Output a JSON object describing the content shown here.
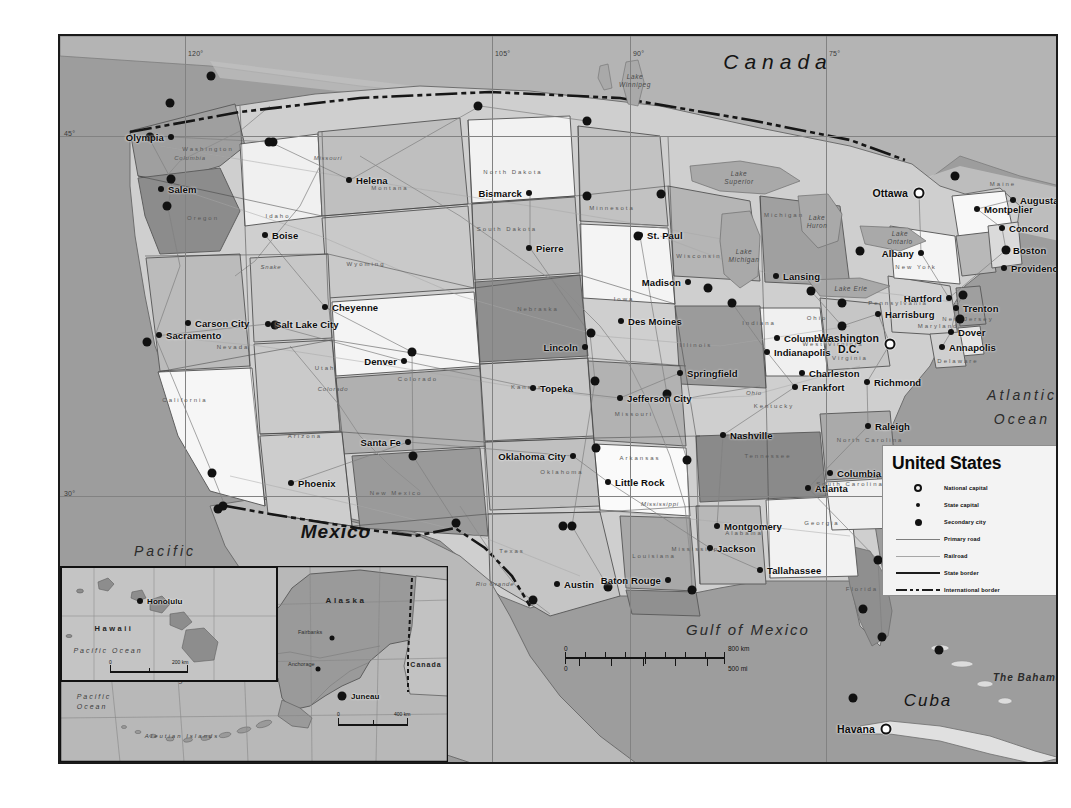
{
  "map": {
    "title": "United States",
    "frame": {
      "width": 1000,
      "height": 730
    }
  },
  "legend": {
    "title": "United States",
    "items": [
      {
        "symbol": "national-capital-icon",
        "label": "National capital"
      },
      {
        "symbol": "state-capital-icon",
        "label": "State capital"
      },
      {
        "symbol": "secondary-city-icon",
        "label": "Secondary city"
      },
      {
        "symbol": "primary-road-icon",
        "label": "Primary road"
      },
      {
        "symbol": "railroad-icon",
        "label": "Railroad"
      },
      {
        "symbol": "state-border-icon",
        "label": "State border"
      },
      {
        "symbol": "international-border-icon",
        "label": "International border"
      }
    ]
  },
  "scalebar": {
    "km_zero": "0",
    "km_max": "800 km",
    "mi_zero": "0",
    "mi_max": "500 mi"
  },
  "graticule": {
    "longitudes": [
      "120°",
      "105°",
      "90°",
      "75°"
    ],
    "latitudes": [
      "45°",
      "30°"
    ]
  },
  "geo_labels": [
    {
      "name": "canada",
      "text": "Canada",
      "x": 718,
      "y": 26,
      "cls": "geo-country"
    },
    {
      "name": "mexico",
      "text": "Mexico",
      "x": 276,
      "y": 496,
      "cls": "geo-mexico"
    },
    {
      "name": "cuba",
      "text": "Cuba",
      "x": 868,
      "y": 665,
      "cls": "geo-cuba"
    },
    {
      "name": "gulf-of-mexico",
      "text": "Gulf of Mexico",
      "x": 688,
      "y": 593,
      "cls": "geo-gulf"
    },
    {
      "name": "the-bahamas",
      "text": "The Bahamas",
      "x": 971,
      "y": 641,
      "cls": "geo-sea-sm"
    }
  ],
  "ocean_labels": [
    {
      "name": "atlantic-ocean",
      "line1": "Atlantic",
      "line2": "Ocean",
      "x": 962,
      "y": 372
    },
    {
      "name": "pacific-ocean",
      "line1": "Pacific",
      "line2": "Ocean",
      "x": 105,
      "y": 528
    }
  ],
  "lakes": [
    {
      "name": "lake-winnipeg",
      "text": "Lake\nWinnipeg",
      "x": 575,
      "y": 45
    },
    {
      "name": "lake-superior",
      "text": "Lake\nSuperior",
      "x": 679,
      "y": 142
    },
    {
      "name": "lake-huron",
      "text": "Lake\nHuron",
      "x": 757,
      "y": 186
    },
    {
      "name": "lake-michigan",
      "text": "Lake\nMichigan",
      "x": 684,
      "y": 220
    },
    {
      "name": "lake-ontario",
      "text": "Lake\nOntario",
      "x": 840,
      "y": 202
    },
    {
      "name": "lake-erie",
      "text": "Lake Erie",
      "x": 791,
      "y": 253
    }
  ],
  "cities": [
    {
      "name": "olympia",
      "label": "Olympia",
      "x": 111,
      "y": 101,
      "type": "state",
      "pos": "left"
    },
    {
      "name": "salem",
      "label": "Salem",
      "x": 101,
      "y": 153,
      "type": "state",
      "pos": "right"
    },
    {
      "name": "boise",
      "label": "Boise",
      "x": 205,
      "y": 199,
      "type": "state",
      "pos": "right"
    },
    {
      "name": "helena",
      "label": "Helena",
      "x": 289,
      "y": 144,
      "type": "state",
      "pos": "right"
    },
    {
      "name": "bismarck",
      "label": "Bismarck",
      "x": 469,
      "y": 157,
      "type": "state",
      "pos": "left"
    },
    {
      "name": "pierre",
      "label": "Pierre",
      "x": 469,
      "y": 212,
      "type": "state",
      "pos": "right"
    },
    {
      "name": "st-paul",
      "label": "St. Paul",
      "x": 580,
      "y": 199,
      "type": "state",
      "pos": "right"
    },
    {
      "name": "madison",
      "label": "Madison",
      "x": 628,
      "y": 246,
      "type": "state",
      "pos": "left"
    },
    {
      "name": "des-moines",
      "label": "Des Moines",
      "x": 561,
      "y": 285,
      "type": "state",
      "pos": "right"
    },
    {
      "name": "lincoln",
      "label": "Lincoln",
      "x": 525,
      "y": 311,
      "type": "state",
      "pos": "left"
    },
    {
      "name": "cheyenne",
      "label": "Cheyenne",
      "x": 265,
      "y": 271,
      "type": "state",
      "pos": "right"
    },
    {
      "name": "denver",
      "label": "Denver",
      "x": 344,
      "y": 325,
      "type": "state",
      "pos": "left"
    },
    {
      "name": "salt-lake-city",
      "label": "Salt Lake City",
      "x": 208,
      "y": 288,
      "type": "state",
      "pos": "right"
    },
    {
      "name": "carson-city",
      "label": "Carson City",
      "x": 128,
      "y": 287,
      "type": "state",
      "pos": "right"
    },
    {
      "name": "sacramento",
      "label": "Sacramento",
      "x": 99,
      "y": 299,
      "type": "state",
      "pos": "right"
    },
    {
      "name": "santa-fe",
      "label": "Santa Fe",
      "x": 348,
      "y": 406,
      "type": "state",
      "pos": "left"
    },
    {
      "name": "phoenix",
      "label": "Phoenix",
      "x": 231,
      "y": 447,
      "type": "state",
      "pos": "right"
    },
    {
      "name": "oklahoma-city",
      "label": "Oklahoma City",
      "x": 513,
      "y": 420,
      "type": "state",
      "pos": "left"
    },
    {
      "name": "topeka",
      "label": "Topeka",
      "x": 473,
      "y": 352,
      "type": "state",
      "pos": "right"
    },
    {
      "name": "jefferson-city",
      "label": "Jefferson City",
      "x": 560,
      "y": 362,
      "type": "state",
      "pos": "right"
    },
    {
      "name": "springfield",
      "label": "Springfield",
      "x": 620,
      "y": 337,
      "type": "state",
      "pos": "right"
    },
    {
      "name": "little-rock",
      "label": "Little Rock",
      "x": 548,
      "y": 446,
      "type": "state",
      "pos": "right"
    },
    {
      "name": "austin",
      "label": "Austin",
      "x": 497,
      "y": 548,
      "type": "state",
      "pos": "right"
    },
    {
      "name": "baton-rouge",
      "label": "Baton Rouge",
      "x": 608,
      "y": 544,
      "type": "state",
      "pos": "left"
    },
    {
      "name": "jackson",
      "label": "Jackson",
      "x": 650,
      "y": 512,
      "type": "state",
      "pos": "right"
    },
    {
      "name": "montgomery",
      "label": "Montgomery",
      "x": 657,
      "y": 490,
      "type": "state",
      "pos": "right"
    },
    {
      "name": "tallahassee",
      "label": "Tallahassee",
      "x": 700,
      "y": 534,
      "type": "state",
      "pos": "right"
    },
    {
      "name": "nashville",
      "label": "Nashville",
      "x": 663,
      "y": 399,
      "type": "state",
      "pos": "right"
    },
    {
      "name": "atlanta",
      "label": "Atlanta",
      "x": 748,
      "y": 452,
      "type": "state",
      "pos": "right"
    },
    {
      "name": "columbia",
      "label": "Columbia",
      "x": 770,
      "y": 437,
      "type": "state",
      "pos": "right"
    },
    {
      "name": "raleigh",
      "label": "Raleigh",
      "x": 808,
      "y": 390,
      "type": "state",
      "pos": "right"
    },
    {
      "name": "richmond",
      "label": "Richmond",
      "x": 807,
      "y": 346,
      "type": "state",
      "pos": "right"
    },
    {
      "name": "frankfort",
      "label": "Frankfort",
      "x": 735,
      "y": 351,
      "type": "state",
      "pos": "right"
    },
    {
      "name": "charleston",
      "label": "Charleston",
      "x": 742,
      "y": 337,
      "type": "state",
      "pos": "right"
    },
    {
      "name": "columbus",
      "label": "Columbus",
      "x": 717,
      "y": 302,
      "type": "state",
      "pos": "right"
    },
    {
      "name": "indianapolis",
      "label": "Indianapolis",
      "x": 707,
      "y": 316,
      "type": "state",
      "pos": "right"
    },
    {
      "name": "lansing",
      "label": "Lansing",
      "x": 716,
      "y": 240,
      "type": "state",
      "pos": "right"
    },
    {
      "name": "harrisburg",
      "label": "Harrisburg",
      "x": 818,
      "y": 278,
      "type": "state",
      "pos": "right"
    },
    {
      "name": "washington-dc",
      "label": "Washington",
      "x": 830,
      "y": 308,
      "type": "national",
      "pos": "left"
    },
    {
      "name": "annapolis",
      "label": "Annapolis",
      "x": 882,
      "y": 311,
      "type": "state",
      "pos": "right"
    },
    {
      "name": "dover",
      "label": "Dover",
      "x": 891,
      "y": 296,
      "type": "state",
      "pos": "right"
    },
    {
      "name": "trenton",
      "label": "Trenton",
      "x": 896,
      "y": 272,
      "type": "state",
      "pos": "right"
    },
    {
      "name": "hartford",
      "label": "Hartford",
      "x": 889,
      "y": 262,
      "type": "state",
      "pos": "left"
    },
    {
      "name": "albany",
      "label": "Albany",
      "x": 861,
      "y": 217,
      "type": "state",
      "pos": "left"
    },
    {
      "name": "providence",
      "label": "Providence",
      "x": 944,
      "y": 232,
      "type": "state",
      "pos": "right"
    },
    {
      "name": "boston",
      "label": "Boston",
      "x": 946,
      "y": 214,
      "type": "secondary",
      "pos": "right"
    },
    {
      "name": "concord",
      "label": "Concord",
      "x": 942,
      "y": 192,
      "type": "state",
      "pos": "right"
    },
    {
      "name": "montpelier",
      "label": "Montpelier",
      "x": 917,
      "y": 173,
      "type": "state",
      "pos": "right"
    },
    {
      "name": "augusta",
      "label": "Augusta",
      "x": 953,
      "y": 164,
      "type": "state",
      "pos": "right"
    },
    {
      "name": "ottawa",
      "label": "Ottawa",
      "x": 859,
      "y": 157,
      "type": "national",
      "pos": "left"
    },
    {
      "name": "havana",
      "label": "Havana",
      "x": 826,
      "y": 693,
      "type": "national",
      "pos": "left"
    }
  ],
  "secondary_cities": [
    {
      "name": "seattle",
      "x": 90,
      "y": 101
    },
    {
      "name": "vancouver",
      "x": 110,
      "y": 67
    },
    {
      "name": "portland",
      "x": 111,
      "y": 143
    },
    {
      "name": "eugene",
      "x": 107,
      "y": 170
    },
    {
      "name": "spokane",
      "x": 151,
      "y": 40
    },
    {
      "name": "great-falls",
      "x": 213,
      "y": 106
    },
    {
      "name": "calgary",
      "x": 209,
      "y": 106
    },
    {
      "name": "regina",
      "x": 418,
      "y": 70
    },
    {
      "name": "winnipeg",
      "x": 527,
      "y": 85
    },
    {
      "name": "fargo",
      "x": 527,
      "y": 160
    },
    {
      "name": "duluth",
      "x": 601,
      "y": 158
    },
    {
      "name": "minneapolis",
      "x": 578,
      "y": 200
    },
    {
      "name": "milwaukee",
      "x": 648,
      "y": 252
    },
    {
      "name": "chicago",
      "x": 672,
      "y": 267
    },
    {
      "name": "detroit",
      "x": 751,
      "y": 255
    },
    {
      "name": "toronto",
      "x": 800,
      "y": 215
    },
    {
      "name": "cleveland",
      "x": 782,
      "y": 267
    },
    {
      "name": "pittsburgh",
      "x": 782,
      "y": 290
    },
    {
      "name": "philadelphia",
      "x": 900,
      "y": 283
    },
    {
      "name": "new-york",
      "x": 903,
      "y": 259
    },
    {
      "name": "montreal",
      "x": 895,
      "y": 140
    },
    {
      "name": "omaha",
      "x": 531,
      "y": 297
    },
    {
      "name": "kansas-city",
      "x": 535,
      "y": 345
    },
    {
      "name": "st-louis",
      "x": 607,
      "y": 358
    },
    {
      "name": "memphis",
      "x": 627,
      "y": 424
    },
    {
      "name": "tulsa",
      "x": 536,
      "y": 412
    },
    {
      "name": "dallas",
      "x": 512,
      "y": 490
    },
    {
      "name": "fort-worth",
      "x": 503,
      "y": 490
    },
    {
      "name": "houston",
      "x": 548,
      "y": 551
    },
    {
      "name": "san-antonio",
      "x": 473,
      "y": 564
    },
    {
      "name": "new-orleans",
      "x": 632,
      "y": 554
    },
    {
      "name": "el-paso",
      "x": 396,
      "y": 487
    },
    {
      "name": "denver-sec",
      "x": 352,
      "y": 316
    },
    {
      "name": "albuquerque",
      "x": 353,
      "y": 420
    },
    {
      "name": "salt-lake-sec",
      "x": 215,
      "y": 289
    },
    {
      "name": "los-angeles",
      "x": 152,
      "y": 437
    },
    {
      "name": "san-diego",
      "x": 163,
      "y": 470
    },
    {
      "name": "tijuana",
      "x": 158,
      "y": 473
    },
    {
      "name": "san-francisco",
      "x": 87,
      "y": 306
    },
    {
      "name": "jacksonville",
      "x": 818,
      "y": 524
    },
    {
      "name": "miami",
      "x": 822,
      "y": 601
    },
    {
      "name": "tampa",
      "x": 803,
      "y": 573
    },
    {
      "name": "nassau",
      "x": 879,
      "y": 614
    },
    {
      "name": "key-west",
      "x": 793,
      "y": 662
    },
    {
      "name": "guantanamo",
      "x": 1003,
      "y": 721
    },
    {
      "name": "mexico-city",
      "x": 627,
      "y": 772
    }
  ],
  "states": [
    {
      "name": "washington",
      "label": "Washington",
      "x": 148,
      "y": 113
    },
    {
      "name": "oregon",
      "label": "Oregon",
      "x": 143,
      "y": 182
    },
    {
      "name": "idaho",
      "label": "Idaho",
      "x": 218,
      "y": 180
    },
    {
      "name": "montana",
      "label": "Montana",
      "x": 330,
      "y": 152
    },
    {
      "name": "wyoming",
      "label": "Wyoming",
      "x": 306,
      "y": 228
    },
    {
      "name": "north-dakota",
      "label": "North Dakota",
      "x": 453,
      "y": 136
    },
    {
      "name": "south-dakota",
      "label": "South Dakota",
      "x": 447,
      "y": 193
    },
    {
      "name": "nebraska",
      "label": "Nebraska",
      "x": 478,
      "y": 273
    },
    {
      "name": "minnesota",
      "label": "Minnesota",
      "x": 552,
      "y": 172
    },
    {
      "name": "iowa",
      "label": "Iowa",
      "x": 564,
      "y": 263
    },
    {
      "name": "wisconsin",
      "label": "Wisconsin",
      "x": 639,
      "y": 220
    },
    {
      "name": "illinois",
      "label": "Illinois",
      "x": 636,
      "y": 309
    },
    {
      "name": "michigan",
      "label": "Michigan",
      "x": 724,
      "y": 179
    },
    {
      "name": "indiana",
      "label": "Indiana",
      "x": 699,
      "y": 287
    },
    {
      "name": "ohio",
      "label": "Ohio",
      "x": 757,
      "y": 282
    },
    {
      "name": "nevada",
      "label": "Nevada",
      "x": 173,
      "y": 311
    },
    {
      "name": "utah",
      "label": "Utah",
      "x": 265,
      "y": 332
    },
    {
      "name": "california",
      "label": "California",
      "x": 125,
      "y": 364
    },
    {
      "name": "colorado",
      "label": "Colorado",
      "x": 358,
      "y": 343
    },
    {
      "name": "kansas",
      "label": "Kansas",
      "x": 467,
      "y": 351
    },
    {
      "name": "missouri",
      "label": "Missouri",
      "x": 574,
      "y": 378
    },
    {
      "name": "kentucky",
      "label": "Kentucky",
      "x": 714,
      "y": 370
    },
    {
      "name": "tennessee",
      "label": "Tennessee",
      "x": 708,
      "y": 420
    },
    {
      "name": "arizona",
      "label": "Arizona",
      "x": 245,
      "y": 400
    },
    {
      "name": "new-mexico",
      "label": "New Mexico",
      "x": 336,
      "y": 457
    },
    {
      "name": "oklahoma",
      "label": "Oklahoma",
      "x": 502,
      "y": 436
    },
    {
      "name": "arkansas",
      "label": "Arkansas",
      "x": 580,
      "y": 422
    },
    {
      "name": "texas",
      "label": "Texas",
      "x": 452,
      "y": 515
    },
    {
      "name": "louisiana",
      "label": "Louisiana",
      "x": 594,
      "y": 520
    },
    {
      "name": "mississippi",
      "label": "Mississippi",
      "x": 637,
      "y": 513
    },
    {
      "name": "alabama",
      "label": "Alabama",
      "x": 684,
      "y": 497
    },
    {
      "name": "georgia",
      "label": "Georgia",
      "x": 762,
      "y": 487
    },
    {
      "name": "florida",
      "label": "Florida",
      "x": 802,
      "y": 553
    },
    {
      "name": "virginia",
      "label": "Virginia",
      "x": 790,
      "y": 322
    },
    {
      "name": "west-virginia",
      "label": "West Virginia",
      "x": 773,
      "y": 308
    },
    {
      "name": "north-carolina",
      "label": "North Carolina",
      "x": 810,
      "y": 404
    },
    {
      "name": "south-carolina",
      "label": "South Carolina",
      "x": 790,
      "y": 448
    },
    {
      "name": "pennsylvania",
      "label": "Pennsylvania",
      "x": 838,
      "y": 267
    },
    {
      "name": "new-york",
      "label": "New York",
      "x": 856,
      "y": 231
    },
    {
      "name": "maine",
      "label": "Maine",
      "x": 943,
      "y": 148
    },
    {
      "name": "new-jersey",
      "label": "New Jersey",
      "x": 908,
      "y": 283
    },
    {
      "name": "delaware",
      "label": "Delaware",
      "x": 898,
      "y": 325
    },
    {
      "name": "maryland",
      "label": "Maryland",
      "x": 878,
      "y": 290
    }
  ],
  "rivers": [
    {
      "name": "columbia-river",
      "label": "Columbia",
      "x": 130,
      "y": 122
    },
    {
      "name": "snake-river",
      "label": "Snake",
      "x": 211,
      "y": 231
    },
    {
      "name": "missouri-river",
      "label": "Missouri",
      "x": 268,
      "y": 122
    },
    {
      "name": "colorado-river",
      "label": "Colorado",
      "x": 273,
      "y": 353
    },
    {
      "name": "rio-grande",
      "label": "Rio Grande",
      "x": 435,
      "y": 548
    },
    {
      "name": "mississippi-river",
      "label": "Mississippi",
      "x": 600,
      "y": 468
    },
    {
      "name": "ohio-river",
      "label": "Ohio",
      "x": 694,
      "y": 357
    }
  ],
  "insets": {
    "hawaii": {
      "name_label": "Hawaii",
      "ocean_label": "Pacific Ocean",
      "city": "Honolulu",
      "scale_zero": "0",
      "scale_max": "200 km"
    },
    "alaska": {
      "name_label": "Alaska",
      "ocean_label": "Pacific Ocean",
      "sea_label": "Bering Sea",
      "islands_label": "Aleutian Islands",
      "canada_label": "Canada",
      "cities": [
        "Juneau",
        "Anchorage",
        "Fairbanks"
      ],
      "scale_zero": "0",
      "scale_max": "400 km"
    }
  }
}
